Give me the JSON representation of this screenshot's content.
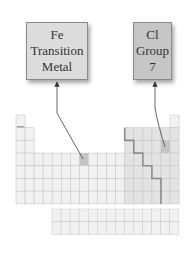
{
  "callouts": [
    {
      "id": "fe",
      "lines": [
        "Fe",
        "Transition",
        "Metal"
      ],
      "fill": "#dcdcdc",
      "target": {
        "period": 4,
        "group": 8
      }
    },
    {
      "id": "cl",
      "lines": [
        "Cl",
        "Group",
        "7"
      ],
      "fill": "#c6c6c6",
      "target": {
        "period": 3,
        "group": 17
      }
    }
  ],
  "table": {
    "columns": 18,
    "rows": 7,
    "origin": [
      16,
      115
    ],
    "cell_w": 9.06,
    "cell_h": 12.7,
    "colors": {
      "s_d_block": "#f1f1f1",
      "p_block": "#e3e3e3",
      "grid_line": "#c9c9c9",
      "highlight": "#c4c4c4",
      "staircase": "#8c8c8c"
    },
    "f_block": {
      "origin": [
        52,
        209
      ],
      "columns": 14,
      "rows": 2
    }
  }
}
